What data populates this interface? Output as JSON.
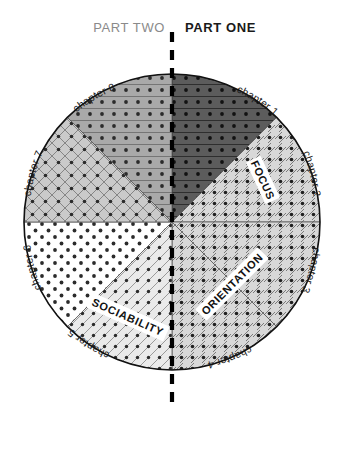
{
  "header": {
    "left_part": "PART TWO",
    "right_part": "PART ONE",
    "divider": "dashed-vertical-divider"
  },
  "diagram": {
    "type": "pie-wheel",
    "center": {
      "x": 172,
      "y": 222
    },
    "radius": 148,
    "sector_count": 8,
    "sectors": [
      {
        "id": "chapter-1",
        "label": "chapter 1",
        "part": "PART ONE",
        "start_deg": -90,
        "end_deg": -45,
        "fill": "#595959",
        "pattern": "horizontal-lines-dots"
      },
      {
        "id": "chapter-2",
        "label": "chapter 2",
        "part": "PART ONE",
        "start_deg": -45,
        "end_deg": 0,
        "fill": "#d5d5d5",
        "pattern": "diagonal-lines-dots"
      },
      {
        "id": "chapter-3",
        "label": "chapter 3",
        "part": "PART ONE",
        "start_deg": 0,
        "end_deg": 45,
        "fill": "#d5d5d5",
        "pattern": "diagonal-lines-dots"
      },
      {
        "id": "chapter-4",
        "label": "chapter 4",
        "part": "PART ONE",
        "start_deg": 45,
        "end_deg": 90,
        "fill": "#d5d5d5",
        "pattern": "diagonal-lines-dots"
      },
      {
        "id": "chapter-5",
        "label": "chapter 5",
        "part": "PART TWO",
        "start_deg": 90,
        "end_deg": 135,
        "fill": "#e6e6e6",
        "pattern": "diagonal-lines-dots"
      },
      {
        "id": "chapter-6",
        "label": "chapter 6",
        "part": "PART TWO",
        "start_deg": 135,
        "end_deg": 180,
        "fill": "#ffffff",
        "pattern": "dots-only"
      },
      {
        "id": "chapter-7",
        "label": "chapter 7",
        "part": "PART TWO",
        "start_deg": 180,
        "end_deg": 225,
        "fill": "#c9c9c9",
        "pattern": "crosshatch-dots"
      },
      {
        "id": "chapter-8",
        "label": "chapter 8",
        "part": "PART TWO",
        "start_deg": 225,
        "end_deg": 270,
        "fill": "#a8a8a8",
        "pattern": "horizontal-lines-dots"
      }
    ],
    "themes": [
      {
        "id": "focus",
        "label": "FOCUS",
        "covers": [
          "chapter 2"
        ]
      },
      {
        "id": "orientation",
        "label": "ORIENTATION",
        "covers": [
          "chapter 3",
          "chapter 4"
        ]
      },
      {
        "id": "sociability",
        "label": "SOCIABILITY",
        "covers": [
          "chapter 5"
        ]
      }
    ],
    "colors": {
      "outline": "#111111",
      "divider": "#000000",
      "part_two_text": "#8a8a8a",
      "part_one_text": "#1a1a1a"
    }
  }
}
